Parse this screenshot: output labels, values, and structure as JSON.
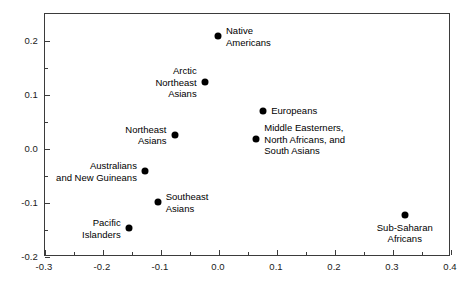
{
  "chart_data": {
    "type": "scatter",
    "title": "",
    "xlabel": "",
    "ylabel": "",
    "xlim": [
      -0.3,
      0.4
    ],
    "ylim": [
      -0.2,
      0.25
    ],
    "grid": false,
    "legend": "none",
    "xticks": [
      "-0.3",
      "-0.2",
      "-0.1",
      "0.0",
      "0.1",
      "0.2",
      "0.3",
      "0.4"
    ],
    "xtick_values": [
      -0.3,
      -0.2,
      -0.1,
      0.0,
      0.1,
      0.2,
      0.3,
      0.4
    ],
    "xminor_values": [
      -0.25,
      -0.15,
      -0.05,
      0.05,
      0.15,
      0.25,
      0.35
    ],
    "yticks": [
      "0.2",
      "0.1",
      "0.0",
      "-0.1",
      "-0.2"
    ],
    "ytick_values": [
      0.2,
      0.1,
      0.0,
      -0.1,
      -0.2
    ],
    "yminor_values": [
      0.15,
      0.05,
      -0.05,
      -0.15
    ],
    "marker": "filled-circle",
    "marker_color": "#000000",
    "points": [
      {
        "label": "Native\nAmericans",
        "x": 0.0,
        "y": 0.207,
        "label_pos": "right"
      },
      {
        "label": "Arctic\nNortheast\nAsians",
        "x": -0.023,
        "y": 0.122,
        "label_pos": "left"
      },
      {
        "label": "Europeans",
        "x": 0.078,
        "y": 0.069,
        "label_pos": "right"
      },
      {
        "label": "Middle Easterners,\nNorth Africans, and\nSouth Asians",
        "x": 0.066,
        "y": 0.016,
        "label_pos": "right"
      },
      {
        "label": "Northeast\nAsians",
        "x": -0.075,
        "y": 0.025,
        "label_pos": "left"
      },
      {
        "label": "Australians\nand New Guineans",
        "x": -0.126,
        "y": -0.043,
        "label_pos": "left"
      },
      {
        "label": "Southeast\nAsians",
        "x": -0.104,
        "y": -0.1,
        "label_pos": "right"
      },
      {
        "label": "Pacific\nIslanders",
        "x": -0.154,
        "y": -0.149,
        "label_pos": "left"
      },
      {
        "label": "Sub-Saharan\nAfricans",
        "x": 0.322,
        "y": -0.124,
        "label_pos": "below"
      }
    ]
  },
  "axes": {
    "frame_color": "#3b3b3b",
    "background": "#ffffff"
  }
}
